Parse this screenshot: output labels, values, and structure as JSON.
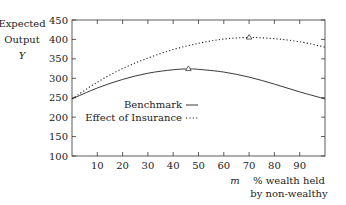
{
  "chart_data": {
    "type": "line",
    "title": "",
    "ylabel_lines": [
      "Expected",
      "Output",
      "Y"
    ],
    "xlabel_symbol": "m",
    "xlabel_lines": [
      "% wealth held",
      "by non-wealthy"
    ],
    "xlim": [
      0,
      100
    ],
    "ylim": [
      100,
      450
    ],
    "xticks": [
      10,
      20,
      30,
      40,
      50,
      60,
      70,
      80,
      90
    ],
    "yticks": [
      100,
      150,
      200,
      250,
      300,
      350,
      400,
      450
    ],
    "grid": false,
    "legend_position": "inside-center-left",
    "series": [
      {
        "name": "Benchmark",
        "style": "solid",
        "x": [
          0,
          10,
          20,
          30,
          40,
          46,
          50,
          60,
          70,
          80,
          90,
          100
        ],
        "y": [
          247,
          275,
          297,
          313,
          322,
          324,
          323,
          316,
          303,
          285,
          265,
          247
        ],
        "peak": {
          "x": 46,
          "y": 324
        }
      },
      {
        "name": "Effect of Insurance",
        "style": "dotted",
        "x": [
          0,
          10,
          20,
          30,
          40,
          50,
          60,
          70,
          80,
          90,
          100
        ],
        "y": [
          247,
          290,
          325,
          352,
          374,
          390,
          401,
          405,
          402,
          394,
          380
        ],
        "peak": {
          "x": 70,
          "y": 405
        }
      }
    ]
  }
}
